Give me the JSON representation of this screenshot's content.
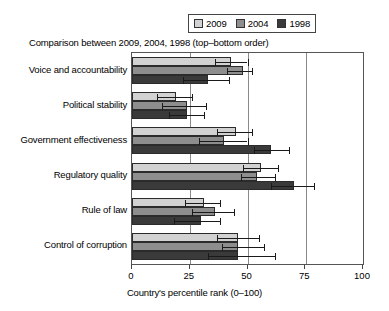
{
  "legend": {
    "entries": [
      {
        "label": "2009",
        "color": "#d2d2d2"
      },
      {
        "label": "2004",
        "color": "#8e8e8e"
      },
      {
        "label": "1998",
        "color": "#3a3a3a"
      }
    ]
  },
  "subtitle": "Comparison between 2009, 2004, 1998 (top–bottom order)",
  "axis": {
    "title": "Country's percentile rank (0–100)",
    "ticks": [
      "0",
      "25",
      "50",
      "75",
      "100"
    ]
  },
  "chart_data": {
    "type": "bar",
    "orientation": "horizontal",
    "title": "Comparison between 2009, 2004, 1998 (top–bottom order)",
    "xlabel": "Country's percentile rank (0–100)",
    "ylabel": "",
    "xlim": [
      0,
      100
    ],
    "xticks": [
      0,
      25,
      50,
      75,
      100
    ],
    "grid": true,
    "legend_position": "top-right",
    "bar_order": "top-bottom: 2009, 2004, 1998",
    "categories": [
      "Voice and accountability",
      "Political stability",
      "Government effectiveness",
      "Regulatory quality",
      "Rule of law",
      "Control of corruption"
    ],
    "series": [
      {
        "name": "2009",
        "color": "#d2d2d2",
        "values": [
          43,
          19,
          45,
          56,
          31,
          46
        ],
        "error_low": [
          36,
          11,
          37,
          48,
          23,
          37
        ],
        "error_high": [
          50,
          26,
          52,
          63,
          38,
          55
        ]
      },
      {
        "name": "2004",
        "color": "#8e8e8e",
        "values": [
          48,
          24,
          40,
          54,
          36,
          46
        ],
        "error_low": [
          41,
          13,
          29,
          47,
          26,
          39
        ],
        "error_high": [
          52,
          32,
          50,
          62,
          44,
          57
        ]
      },
      {
        "name": "1998",
        "color": "#3a3a3a",
        "values": [
          33,
          24,
          60,
          70,
          30,
          46
        ],
        "error_low": [
          22,
          16,
          53,
          60,
          18,
          33
        ],
        "error_high": [
          42,
          31,
          68,
          79,
          38,
          62
        ]
      }
    ]
  }
}
